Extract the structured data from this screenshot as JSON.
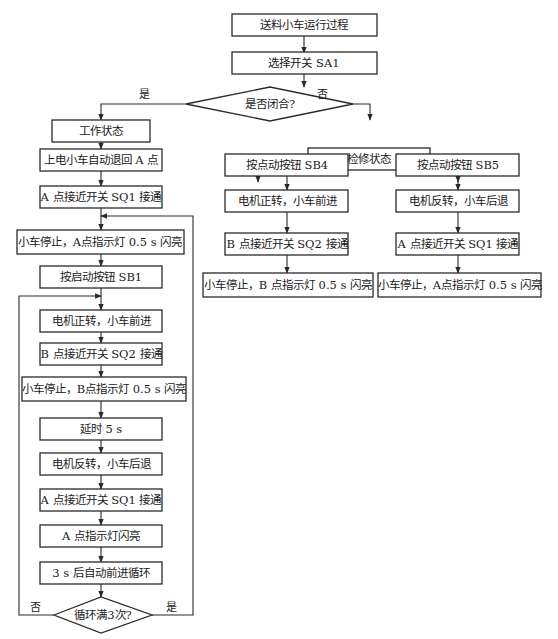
{
  "diagram": {
    "type": "flowchart",
    "nodes": {
      "start": "送料小车运行过程",
      "select": "选择开关 SA1",
      "decision1": "是否闭合?",
      "work": "工作状态",
      "w1": "上电小车自动退回 A 点",
      "w2": "A 点接近开关 SQ1 接通",
      "w3": "小车停止，A点指示灯 0.5 s 闪亮",
      "w4": "按启动按钮 SB1",
      "w5": "电机正转，小车前进",
      "w6": "B 点接近开关 SQ2 接通",
      "w7": "小车停止，B点指示灯 0.5 s 闪亮",
      "w8": "延时 5 s",
      "w9": "电机反转，小车后退",
      "w10": "A 点接近开关 SQ1 接通",
      "w11": "A 点指示灯闪亮",
      "w12": "3 s 后自动前进循环",
      "decision2": "循环满3次?",
      "maint": "检修状态",
      "m1": "按点动按钮 SB4",
      "m2": "电机正转，小车前进",
      "m3": "B 点接近开关 SQ2 接通",
      "m4": "小车停止，B 点指示灯 0.5 s 闪亮",
      "n1": "按点动按钮 SB5",
      "n2": "电机反转，小车后退",
      "n3": "A 点接近开关 SQ1 接通",
      "n4": "小车停止，A点指示灯 0.5 s 闪亮"
    },
    "edge_labels": {
      "d1_yes": "是",
      "d1_no": "否",
      "d2_no": "否",
      "d2_yes": "是"
    }
  }
}
